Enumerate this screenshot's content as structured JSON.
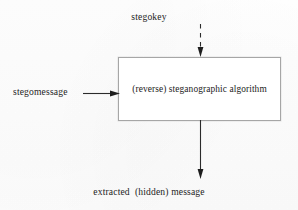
{
  "diagram": {
    "canvas": {
      "width": 298,
      "height": 210,
      "background": "#fefefe"
    },
    "stroke_color": "#2b2b2b",
    "box_border_color": "#a6a6a6",
    "text_color": "#1d1d1d",
    "inputs": {
      "key": {
        "label": "stegokey",
        "arrow_style": "dashed",
        "direction": "down"
      },
      "message": {
        "label": "stegomessage",
        "arrow_style": "solid",
        "direction": "right"
      }
    },
    "process": {
      "label": "(reverse) steganographic algorithm"
    },
    "output": {
      "label": "extracted  (hidden) message",
      "arrow_style": "solid",
      "direction": "down"
    }
  }
}
